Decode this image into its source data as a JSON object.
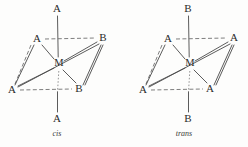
{
  "figure": {
    "background": "#fdfdfc",
    "bond_color": "#4a4a4a",
    "dashed_bond_color": "#6f6f6f",
    "label_color": "#2b2b2b",
    "caption_color": "#3a3a3a"
  },
  "diagrams": [
    {
      "id": "cis",
      "caption": "cis",
      "caption_x": 57,
      "caption_y": 134,
      "center": {
        "label": "M",
        "x": 59,
        "y": 64
      },
      "axial": [
        {
          "label": "A",
          "x": 57,
          "y": 9,
          "position": "top"
        },
        {
          "label": "A",
          "x": 57,
          "y": 119,
          "position": "bottom"
        }
      ],
      "equatorial": [
        {
          "label": "A",
          "x": 37,
          "y": 39,
          "position": "upper-left"
        },
        {
          "label": "B",
          "x": 103,
          "y": 38,
          "position": "upper-right"
        },
        {
          "label": "A",
          "x": 12,
          "y": 90,
          "position": "lower-left"
        },
        {
          "label": "B",
          "x": 79,
          "y": 89,
          "position": "lower-right"
        }
      ]
    },
    {
      "id": "trans",
      "caption": "trans",
      "caption_x": 184,
      "caption_y": 134,
      "center": {
        "label": "M",
        "x": 190,
        "y": 64
      },
      "axial": [
        {
          "label": "B",
          "x": 188,
          "y": 9,
          "position": "top"
        },
        {
          "label": "B",
          "x": 188,
          "y": 119,
          "position": "bottom"
        }
      ],
      "equatorial": [
        {
          "label": "A",
          "x": 168,
          "y": 39,
          "position": "upper-left"
        },
        {
          "label": "A",
          "x": 234,
          "y": 38,
          "position": "upper-right"
        },
        {
          "label": "A",
          "x": 143,
          "y": 90,
          "position": "lower-left"
        },
        {
          "label": "A",
          "x": 210,
          "y": 89,
          "position": "lower-right"
        }
      ]
    }
  ]
}
